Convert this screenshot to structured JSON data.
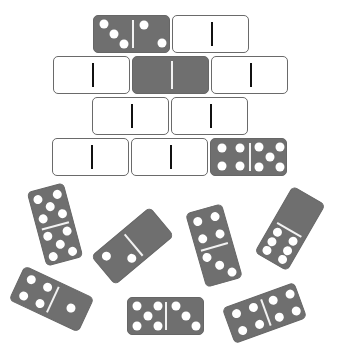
{
  "puzzle": {
    "grid_rows": [
      {
        "row": 1,
        "pieces": [
          {
            "x": 93,
            "y": 15,
            "style": "dark",
            "left": 3,
            "right": 2
          },
          {
            "x": 172,
            "y": 15,
            "style": "blank",
            "left": null,
            "right": null
          }
        ]
      },
      {
        "row": 2,
        "pieces": [
          {
            "x": 53,
            "y": 56,
            "style": "blank",
            "left": null,
            "right": null
          },
          {
            "x": 132,
            "y": 56,
            "style": "dark",
            "left": 0,
            "right": 0
          },
          {
            "x": 211,
            "y": 56,
            "style": "blank",
            "left": null,
            "right": null
          }
        ]
      },
      {
        "row": 3,
        "pieces": [
          {
            "x": 92,
            "y": 97,
            "style": "blank",
            "left": null,
            "right": null
          },
          {
            "x": 171,
            "y": 97,
            "style": "blank",
            "left": null,
            "right": null
          }
        ]
      },
      {
        "row": 4,
        "pieces": [
          {
            "x": 52,
            "y": 138,
            "style": "blank",
            "left": null,
            "right": null
          },
          {
            "x": 131,
            "y": 138,
            "style": "blank",
            "left": null,
            "right": null
          },
          {
            "x": 210,
            "y": 138,
            "style": "dark",
            "left": 4,
            "right": 5
          }
        ]
      }
    ],
    "loose_pieces": [
      {
        "id": "A",
        "cx": 55,
        "cy": 224,
        "rotate": -15,
        "orientation": "vertical",
        "top": 5,
        "bottom": 5
      },
      {
        "id": "B",
        "cx": 132,
        "cy": 246,
        "rotate": -40,
        "orientation": "horizontal",
        "left": 2,
        "right": 0
      },
      {
        "id": "C",
        "cx": 214,
        "cy": 245,
        "rotate": -16,
        "orientation": "vertical",
        "top": 4,
        "bottom": 3
      },
      {
        "id": "D",
        "cx": 290,
        "cy": 228,
        "rotate": 30,
        "orientation": "vertical",
        "top": 0,
        "bottom": 6
      },
      {
        "id": "E",
        "cx": 51,
        "cy": 299,
        "rotate": 25,
        "orientation": "horizontal",
        "left": 4,
        "right": 1
      },
      {
        "id": "F",
        "cx": 165,
        "cy": 316,
        "rotate": 0,
        "orientation": "horizontal",
        "left": 5,
        "right": 3
      },
      {
        "id": "G",
        "cx": 264,
        "cy": 313,
        "rotate": -20,
        "orientation": "horizontal",
        "left": 4,
        "right": 4
      }
    ],
    "colors": {
      "dark": "#6f6f6f",
      "blank_border": "#6a6a6a",
      "pip": "#ffffff",
      "divider_blank": "#111111"
    }
  }
}
